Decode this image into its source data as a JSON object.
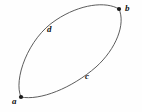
{
  "figure": {
    "type": "graph-diagram",
    "background_color": "#fefefe",
    "stroke_color": "#4a4a4a",
    "label_color": "#111111",
    "vertex_color": "#1a1a1a",
    "width": 142,
    "height": 112,
    "vertices": [
      {
        "id": "a",
        "label": "a",
        "x": 21,
        "y": 97,
        "label_x": 12,
        "label_y": 97,
        "radius": 2.1
      },
      {
        "id": "b",
        "label": "b",
        "x": 119,
        "y": 9,
        "label_x": 125,
        "label_y": 4,
        "radius": 2.1
      }
    ],
    "edges": [
      {
        "id": "d",
        "label": "d",
        "side": "upper-left",
        "label_x": 47,
        "label_y": 25,
        "path": "M 21 97 C 13 80 28 38 56 20 C 80 4 106 1 119 9"
      },
      {
        "id": "c",
        "label": "c",
        "side": "lower-right",
        "label_x": 85,
        "label_y": 72,
        "path": "M 21 97 C 40 101 72 88 96 67 C 116 49 126 24 119 9"
      }
    ]
  }
}
